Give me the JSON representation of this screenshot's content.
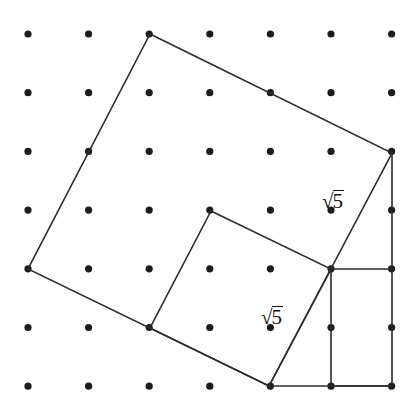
{
  "figure": {
    "background_color": "#ffffff",
    "stroke_color": "#2b2b2b",
    "dot_color": "#1c1c1c",
    "width": 419,
    "height": 405
  },
  "grid": {
    "name": "square-dot-lattice",
    "columns": 7,
    "rows": 7,
    "origin_x": 28,
    "origin_y": 34,
    "spacing_x": 60.6,
    "spacing_y": 58.7,
    "dot_radius": 3.6,
    "dot_count": 49
  },
  "shapes": {
    "large_square": {
      "label": "large-tilted-square",
      "side_length_text": "2√5",
      "points": [
        [
          150,
          34
        ],
        [
          392,
          153
        ],
        [
          269,
          386
        ],
        [
          28,
          269
        ]
      ]
    },
    "small_square": {
      "label": "small-tilted-square",
      "side_length_text": "√5",
      "points": [
        [
          211,
          211
        ],
        [
          331,
          269
        ],
        [
          269,
          386
        ],
        [
          150,
          328
        ]
      ]
    },
    "right_rectangle": {
      "label": "right-axis-aligned-rectangle",
      "points": [
        [
          331,
          269
        ],
        [
          392,
          269
        ],
        [
          392,
          386
        ],
        [
          331,
          386
        ]
      ]
    },
    "vertical_segment": {
      "label": "right-vertical-segment",
      "from": [
        392,
        153
      ],
      "to": [
        392,
        269
      ]
    },
    "bottom_segment": {
      "label": "bottom-horizontal-segment",
      "from": [
        269,
        386
      ],
      "to": [
        392,
        386
      ]
    }
  },
  "labels": [
    {
      "id": "label-upper-sqrt5",
      "name": "length-label-upper",
      "radical": "√",
      "radicand": "5",
      "text": "√5",
      "x": 322,
      "y": 190
    },
    {
      "id": "label-lower-sqrt5",
      "name": "length-label-lower",
      "radical": "√",
      "radicand": "5",
      "text": "√5",
      "x": 261,
      "y": 306
    }
  ]
}
